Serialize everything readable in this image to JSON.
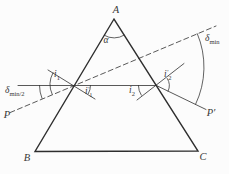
{
  "figure": {
    "background": "#fcfcfc",
    "line_color": "#2e2e2e",
    "text_color": "#383838"
  },
  "labels": {
    "vertex_a": "A",
    "vertex_b": "B",
    "vertex_c": "C",
    "apex_angle": "α",
    "ray_start": "P",
    "ray_end": "P′",
    "i1": {
      "base": "i",
      "sub": "1"
    },
    "i1_prime": {
      "base": "i",
      "prime": "′",
      "sub": "1"
    },
    "i2": {
      "base": "i",
      "sub": "2"
    },
    "i2_prime": {
      "base": "i",
      "prime": "′",
      "sub": "2"
    },
    "delta_min": {
      "base": "δ",
      "sub": "min"
    },
    "delta_min_half": {
      "base": "δ",
      "sub": "min/2"
    }
  }
}
